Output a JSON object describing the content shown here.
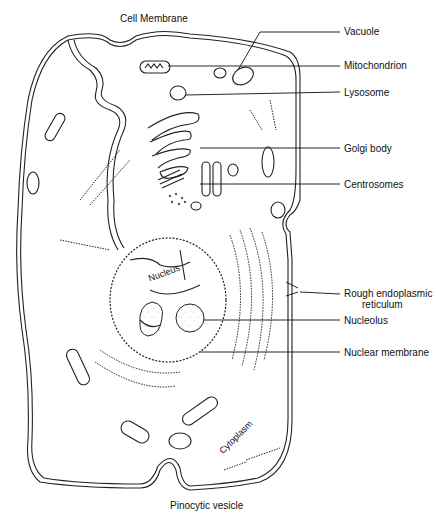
{
  "diagram": {
    "labels": {
      "cell_membrane": "Cell Membrane",
      "vacuole": "Vacuole",
      "mitochondrion": "Mitochondrion",
      "lysosome": "Lysosome",
      "golgi_body": "Golgi body",
      "centrosomes": "Centrosomes",
      "rough_er_line1": "Rough endoplasmic",
      "rough_er_line2": "reticulum",
      "nucleolus": "Nucleolus",
      "nuclear_membrane": "Nuclear membrane",
      "nucleus": "Nucleus",
      "cytoplasm": "Cytoplasm",
      "pinocytic_vesicle": "Pinocytic vesicle"
    },
    "colors": {
      "ink": "#222222",
      "background": "#ffffff",
      "stipple": "#777777"
    }
  }
}
